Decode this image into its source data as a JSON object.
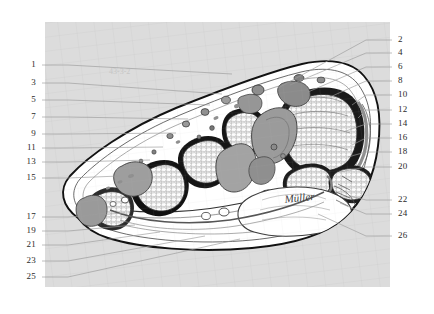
{
  "figure": {
    "panel": {
      "fill_color": "#dcdcdc",
      "x": 45,
      "y": 22,
      "width": 345,
      "height": 265
    },
    "artist_signature": "Müller",
    "faint_inscription": "43-3-2"
  },
  "labels": {
    "left": [
      {
        "id": "1",
        "text": "1",
        "y": 65,
        "leader_to_x": 232,
        "leader_to_y": 74
      },
      {
        "id": "3",
        "text": "3",
        "y": 83,
        "leader_to_x": 222,
        "leader_to_y": 94
      },
      {
        "id": "5",
        "text": "5",
        "y": 100,
        "leader_to_x": 210,
        "leader_to_y": 105
      },
      {
        "id": "7",
        "text": "7",
        "y": 117,
        "leader_to_x": 188,
        "leader_to_y": 119
      },
      {
        "id": "9",
        "text": "9",
        "y": 134,
        "leader_to_x": 176,
        "leader_to_y": 133
      },
      {
        "id": "11",
        "text": "11",
        "y": 148,
        "leader_to_x": 163,
        "leader_to_y": 147
      },
      {
        "id": "13",
        "text": "13",
        "y": 162,
        "leader_to_x": 150,
        "leader_to_y": 160
      },
      {
        "id": "15",
        "text": "15",
        "y": 178,
        "leader_to_x": 120,
        "leader_to_y": 176
      },
      {
        "id": "17",
        "text": "17",
        "y": 217,
        "leader_to_x": 125,
        "leader_to_y": 213
      },
      {
        "id": "19",
        "text": "19",
        "y": 231,
        "leader_to_x": 135,
        "leader_to_y": 225
      },
      {
        "id": "21",
        "text": "21",
        "y": 245,
        "leader_to_x": 160,
        "leader_to_y": 232
      },
      {
        "id": "23",
        "text": "23",
        "y": 261,
        "leader_to_x": 205,
        "leader_to_y": 236
      },
      {
        "id": "25",
        "text": "25",
        "y": 277,
        "leader_to_x": 240,
        "leader_to_y": 239
      }
    ],
    "right": [
      {
        "id": "2",
        "text": "2",
        "y": 40,
        "leader_to_x": 278,
        "leader_to_y": 88
      },
      {
        "id": "4",
        "text": "4",
        "y": 53,
        "leader_to_x": 290,
        "leader_to_y": 85
      },
      {
        "id": "6",
        "text": "6",
        "y": 67,
        "leader_to_x": 308,
        "leader_to_y": 92
      },
      {
        "id": "8",
        "text": "8",
        "y": 81,
        "leader_to_x": 330,
        "leader_to_y": 97
      },
      {
        "id": "10",
        "text": "10",
        "y": 95,
        "leader_to_x": 352,
        "leader_to_y": 105
      },
      {
        "id": "12",
        "text": "12",
        "y": 110,
        "leader_to_x": 358,
        "leader_to_y": 118
      },
      {
        "id": "14",
        "text": "14",
        "y": 124,
        "leader_to_x": 346,
        "leader_to_y": 131
      },
      {
        "id": "16",
        "text": "16",
        "y": 138,
        "leader_to_x": 352,
        "leader_to_y": 145
      },
      {
        "id": "18",
        "text": "18",
        "y": 152,
        "leader_to_x": 348,
        "leader_to_y": 157
      },
      {
        "id": "20",
        "text": "20",
        "y": 167,
        "leader_to_x": 340,
        "leader_to_y": 172
      },
      {
        "id": "22",
        "text": "22",
        "y": 200,
        "leader_to_x": 350,
        "leader_to_y": 196
      },
      {
        "id": "24",
        "text": "24",
        "y": 214,
        "leader_to_x": 340,
        "leader_to_y": 203
      },
      {
        "id": "26",
        "text": "26",
        "y": 236,
        "leader_to_x": 318,
        "leader_to_y": 214
      }
    ]
  },
  "geometry": {
    "label_x_left": 36,
    "label_x_right": 398,
    "leader_start_left": 42,
    "leader_start_right": 392,
    "leader_color": "#9a9a9a"
  }
}
